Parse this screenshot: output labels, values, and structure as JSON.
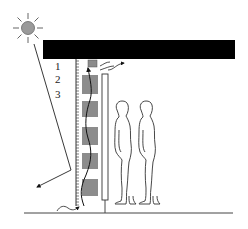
{
  "diagram": {
    "type": "building-section-solar-wall",
    "labels": {
      "layer1": "1",
      "layer2": "2",
      "layer3": "3"
    },
    "colors": {
      "background": "#ffffff",
      "roof": "#000000",
      "sun_fill": "#9a9a9a",
      "panel_fill": "#8c8c8c",
      "line": "#222222"
    },
    "elements": {
      "sun": "sun-icon",
      "roof": "black roof slab",
      "wall": "ruler-textured exterior wall",
      "panels_count": 5,
      "vent_box": "top vent box",
      "column": "tall narrow column",
      "people_count": 2,
      "ground": "ground line"
    }
  }
}
